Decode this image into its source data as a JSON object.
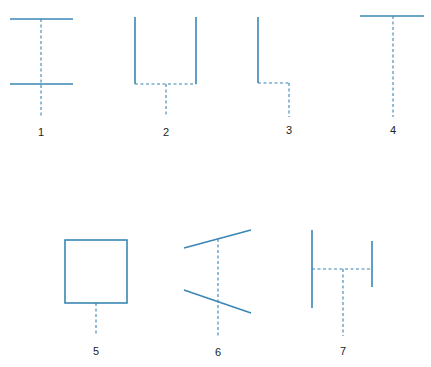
{
  "diagram": {
    "line_color": "#3a86b4",
    "figures": [
      {
        "label": "1",
        "description": "two horizontal solid lines joined by a vertical dashed line extending below"
      },
      {
        "label": "2",
        "description": "U-shape: two vertical solid lines joined by a dashed base, dashed stem down from center"
      },
      {
        "label": "3",
        "description": "vertical solid line with dashed horizontal step and dashed vertical stem"
      },
      {
        "label": "4",
        "description": "horizontal solid line with dashed vertical stem (T-shape)"
      },
      {
        "label": "5",
        "description": "solid square with dashed stem below"
      },
      {
        "label": "6",
        "description": "two slanted solid lines converging left, crossed by vertical dashed line"
      },
      {
        "label": "7",
        "description": "two vertical solid lines of different length joined by dashed horizontal, with dashed stem down"
      }
    ]
  }
}
